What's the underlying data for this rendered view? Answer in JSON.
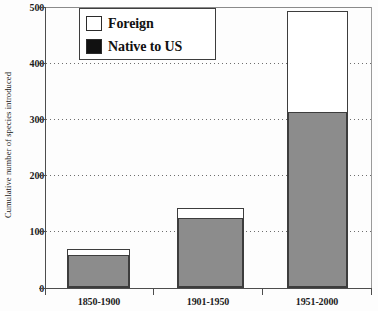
{
  "chart_data": {
    "type": "bar",
    "title": "",
    "subtitle": "",
    "xlabel": "",
    "ylabel": "Cumulative number of species introduced",
    "categories": [
      "1850-1900",
      "1901-1950",
      "1951-2000"
    ],
    "stacked": true,
    "series": [
      {
        "name": "Native to US",
        "color": "#8c8c8c",
        "values": [
          57,
          123,
          312
        ]
      },
      {
        "name": "Foreign",
        "color": "#ffffff",
        "values": [
          13,
          20,
          180
        ]
      }
    ],
    "totals": [
      70,
      143,
      492
    ],
    "ylim": [
      0,
      500
    ],
    "yticks": [
      0,
      100,
      200,
      300,
      400,
      500
    ],
    "ytick_labels": [
      "0",
      "100",
      "200",
      "300",
      "400",
      "500"
    ],
    "grid": "horizontal-dotted",
    "legend": {
      "position": "top-left-inside",
      "entries": [
        {
          "label": "Foreign",
          "swatch": "white"
        },
        {
          "label": "Native to US",
          "swatch": "black"
        }
      ]
    }
  },
  "axis": {
    "y_title": "Cumulative number of species introduced",
    "y_ticks": [
      {
        "label": "500",
        "value": 500
      },
      {
        "label": "400",
        "value": 400
      },
      {
        "label": "300",
        "value": 300
      },
      {
        "label": "200",
        "value": 200
      },
      {
        "label": "100",
        "value": 100
      },
      {
        "label": "0",
        "value": 0
      }
    ],
    "x_ticks": [
      {
        "label": "1850-1900"
      },
      {
        "label": "1901-1950"
      },
      {
        "label": "1951-2000"
      }
    ]
  },
  "legend": {
    "items": [
      {
        "label": "Foreign"
      },
      {
        "label": "Native to US"
      }
    ]
  }
}
